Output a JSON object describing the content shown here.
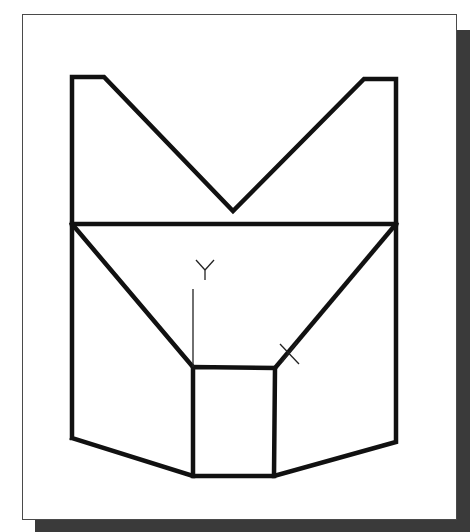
{
  "figure": {
    "frame": {
      "background": "#ffffff",
      "border_color": "#4a4a4a",
      "shadow_color": "#3a3a3a"
    },
    "axis_labels": {
      "y": "Y"
    },
    "cursor_marker": "x-cross",
    "colors": {
      "outline": "#111111"
    }
  }
}
